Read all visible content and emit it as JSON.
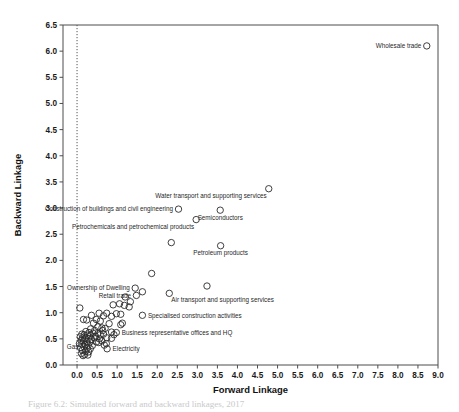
{
  "figure": {
    "caption": "Figure 6.2: Simulated forward and backward linkages, 2017"
  },
  "chart_data": {
    "type": "scatter",
    "title": "",
    "xlabel": "Forward Linkage",
    "ylabel": "Backward Linkage",
    "xlim": [
      -0.35,
      9.0
    ],
    "ylim": [
      0.0,
      6.5
    ],
    "xticks": [
      "0.0",
      "0.5",
      "1.0",
      "1.5",
      "2.0",
      "2.5",
      "3.0",
      "3.5",
      "4.0",
      "4.5",
      "5.0",
      "5.5",
      "6.0",
      "6.5",
      "7.0",
      "7.5",
      "8.0",
      "8.5",
      "9.0"
    ],
    "yticks": [
      "0.0",
      "0.5",
      "1.0",
      "1.5",
      "2.0",
      "2.5",
      "3.0",
      "3.5",
      "4.0",
      "4.5",
      "5.0",
      "5.5",
      "6.0",
      "6.5"
    ],
    "grid": false,
    "legend": null,
    "reference_line": {
      "orientation": "vertical",
      "x": 0.0,
      "style": "dotted"
    },
    "marker": {
      "shape": "open-circle",
      "size": 3.2,
      "color": "#2b2b2b"
    },
    "labelled_points": [
      {
        "label": "Wholesale trade",
        "x": 8.72,
        "y": 6.1,
        "label_side": "left"
      },
      {
        "label": "Water transport and supporting services",
        "x": 4.78,
        "y": 3.37,
        "label_side": "below-left"
      },
      {
        "label": "Construction of buildings and civil engineering",
        "x": 2.53,
        "y": 2.98,
        "label_side": "left"
      },
      {
        "label": "Semiconductors",
        "x": 3.57,
        "y": 2.96,
        "label_side": "below"
      },
      {
        "label": "Petrochemicals and petrochemical products",
        "x": 2.97,
        "y": 2.78,
        "label_side": "below-left"
      },
      {
        "label": "Petroleum products",
        "x": 3.58,
        "y": 2.28,
        "label_side": "below"
      },
      {
        "label": "Ownership of Dwelling",
        "x": 1.45,
        "y": 1.47,
        "label_side": "left"
      },
      {
        "label": "Retail trade",
        "x": 1.48,
        "y": 1.33,
        "label_side": "left"
      },
      {
        "label": "Air transport and supporting services",
        "x": 2.3,
        "y": 1.37,
        "label_side": "below-right"
      },
      {
        "label": "Specialised construction activities",
        "x": 1.63,
        "y": 0.95,
        "label_side": "right"
      },
      {
        "label": "Business representative offices and HQ",
        "x": 0.98,
        "y": 0.62,
        "label_side": "right"
      },
      {
        "label": "Electricity",
        "x": 0.75,
        "y": 0.31,
        "label_side": "right"
      },
      {
        "label": "Gas",
        "x": 0.17,
        "y": 0.35,
        "label_side": "left"
      }
    ],
    "points": [
      [
        8.72,
        6.1
      ],
      [
        4.78,
        3.37
      ],
      [
        3.57,
        2.96
      ],
      [
        2.53,
        2.98
      ],
      [
        2.97,
        2.78
      ],
      [
        3.58,
        2.28
      ],
      [
        2.35,
        2.34
      ],
      [
        1.86,
        1.75
      ],
      [
        3.24,
        1.51
      ],
      [
        1.45,
        1.47
      ],
      [
        1.48,
        1.33
      ],
      [
        1.63,
        1.4
      ],
      [
        2.3,
        1.37
      ],
      [
        1.2,
        1.3
      ],
      [
        1.33,
        1.21
      ],
      [
        1.06,
        1.17
      ],
      [
        1.18,
        1.14
      ],
      [
        1.3,
        1.11
      ],
      [
        0.9,
        1.15
      ],
      [
        0.07,
        1.09
      ],
      [
        0.55,
        0.99
      ],
      [
        0.74,
        0.99
      ],
      [
        0.98,
        0.98
      ],
      [
        1.09,
        0.97
      ],
      [
        0.66,
        0.94
      ],
      [
        0.86,
        0.93
      ],
      [
        1.63,
        0.95
      ],
      [
        0.16,
        0.87
      ],
      [
        0.24,
        0.86
      ],
      [
        1.13,
        0.8
      ],
      [
        1.09,
        0.77
      ],
      [
        0.8,
        0.79
      ],
      [
        0.52,
        0.73
      ],
      [
        0.62,
        0.71
      ],
      [
        0.7,
        0.7
      ],
      [
        0.34,
        0.69
      ],
      [
        0.44,
        0.66
      ],
      [
        0.22,
        0.64
      ],
      [
        0.3,
        0.62
      ],
      [
        0.98,
        0.62
      ],
      [
        0.86,
        0.63
      ],
      [
        0.4,
        0.61
      ],
      [
        0.52,
        0.6
      ],
      [
        0.12,
        0.59
      ],
      [
        0.18,
        0.58
      ],
      [
        0.26,
        0.57
      ],
      [
        0.34,
        0.56
      ],
      [
        0.46,
        0.55
      ],
      [
        0.58,
        0.58
      ],
      [
        0.66,
        0.59
      ],
      [
        0.08,
        0.54
      ],
      [
        0.14,
        0.52
      ],
      [
        0.2,
        0.51
      ],
      [
        0.28,
        0.5
      ],
      [
        0.36,
        0.49
      ],
      [
        0.44,
        0.52
      ],
      [
        0.56,
        0.5
      ],
      [
        0.1,
        0.47
      ],
      [
        0.16,
        0.46
      ],
      [
        0.24,
        0.45
      ],
      [
        0.32,
        0.44
      ],
      [
        0.48,
        0.44
      ],
      [
        0.62,
        0.46
      ],
      [
        0.74,
        0.52
      ],
      [
        0.06,
        0.41
      ],
      [
        0.12,
        0.4
      ],
      [
        0.2,
        0.39
      ],
      [
        0.28,
        0.38
      ],
      [
        0.38,
        0.37
      ],
      [
        0.17,
        0.35
      ],
      [
        0.09,
        0.33
      ],
      [
        0.25,
        0.32
      ],
      [
        0.33,
        0.31
      ],
      [
        0.75,
        0.31
      ],
      [
        0.73,
        0.41
      ],
      [
        0.13,
        0.28
      ],
      [
        0.21,
        0.26
      ],
      [
        0.29,
        0.25
      ],
      [
        0.11,
        0.22
      ],
      [
        0.19,
        0.2
      ],
      [
        0.27,
        0.19
      ],
      [
        0.15,
        0.18
      ],
      [
        0.86,
        0.51
      ],
      [
        0.92,
        0.58
      ],
      [
        0.41,
        0.8
      ],
      [
        0.58,
        0.84
      ],
      [
        0.48,
        0.87
      ],
      [
        0.36,
        0.95
      ],
      [
        0.64,
        0.66
      ],
      [
        0.54,
        0.43
      ],
      [
        0.68,
        0.38
      ]
    ]
  }
}
